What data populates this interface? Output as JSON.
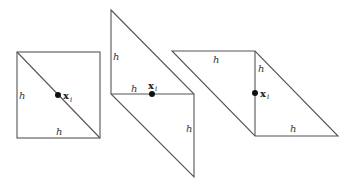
{
  "figure": {
    "edge_color": "#555555",
    "point_color": "#111111",
    "panels": [
      {
        "name": "square-split-diagonal",
        "labels": {
          "left_edge": "h",
          "bottom_edge": "h"
        },
        "point": {
          "symbol": "x",
          "subscript": "i"
        }
      },
      {
        "name": "vertical-parallelogram-split",
        "labels": {
          "upper_left_edge": "h",
          "middle_edge": "h",
          "lower_right_edge": "h"
        },
        "point": {
          "symbol": "x",
          "subscript": "i"
        }
      },
      {
        "name": "horizontal-parallelogram-split",
        "labels": {
          "top_edge": "h",
          "middle_vertical_edge": "h",
          "bottom_edge": "h"
        },
        "point": {
          "symbol": "x",
          "subscript": "i"
        }
      }
    ]
  }
}
